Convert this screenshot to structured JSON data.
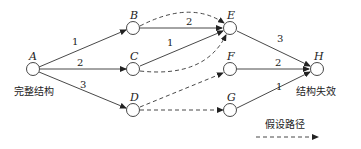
{
  "nodes": {
    "A": {
      "label": "A",
      "caption": "完整结构"
    },
    "B": {
      "label": "B"
    },
    "C": {
      "label": "C"
    },
    "D": {
      "label": "D"
    },
    "E": {
      "label": "E"
    },
    "F": {
      "label": "F"
    },
    "G": {
      "label": "G"
    },
    "H": {
      "label": "H",
      "caption": "结构失效"
    }
  },
  "edges": {
    "AB": {
      "weight": "1",
      "style": "solid"
    },
    "AC": {
      "weight": "2",
      "style": "solid"
    },
    "AD": {
      "weight": "3",
      "style": "solid"
    },
    "BE": {
      "weight": "2",
      "style": "solid"
    },
    "CE": {
      "weight": "1",
      "style": "solid"
    },
    "EH": {
      "weight": "3",
      "style": "solid"
    },
    "FH": {
      "weight": "2",
      "style": "solid"
    },
    "GH": {
      "weight": "1",
      "style": "solid"
    },
    "BE_dashed": {
      "style": "dashed"
    },
    "CE_dashed": {
      "style": "dashed"
    },
    "DF_dashed": {
      "style": "dashed"
    },
    "DG_dashed": {
      "style": "dashed"
    }
  },
  "legend": {
    "label": "假设路径",
    "style": "dashed-arrow"
  }
}
